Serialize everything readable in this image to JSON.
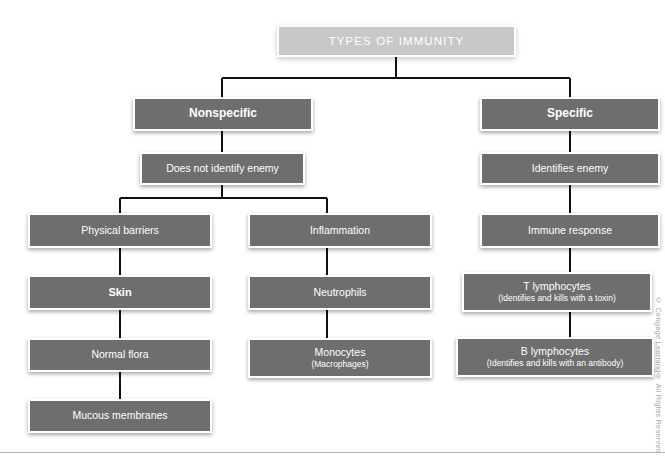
{
  "diagram": {
    "title_box": {
      "label": "TYPES OF IMMUNITY"
    },
    "branches": {
      "nonspecific": {
        "root": "Nonspecific",
        "descriptor": "Does not identify enemy",
        "columns": [
          {
            "heading": "Physical barriers",
            "items": [
              {
                "main": "Skin",
                "sub": ""
              },
              {
                "main": "Normal flora",
                "sub": ""
              },
              {
                "main": "Mucous membranes",
                "sub": ""
              }
            ]
          },
          {
            "heading": "Inflammation",
            "items": [
              {
                "main": "Neutrophils",
                "sub": ""
              },
              {
                "main": "Monocytes",
                "sub": "(Macrophages)"
              }
            ]
          }
        ]
      },
      "specific": {
        "root": "Specific",
        "descriptor": "Identifies enemy",
        "columns": [
          {
            "heading": "Immune response",
            "items": [
              {
                "main": "T lymphocytes",
                "sub": "(Identifies and kills with a toxin)"
              },
              {
                "main": "B lymphocytes",
                "sub": "(Identifies and kills with an antibody)"
              }
            ]
          }
        ]
      }
    }
  },
  "credit": {
    "text": "© Cengage Learning® All Rights Reserved."
  },
  "colors": {
    "title_box_fill": "#c8c8c8",
    "node_fill": "#6e6e6e",
    "node_border": "#ffffff",
    "node_text": "#ffffff",
    "connector": "#000000",
    "page_background": "#ffffff",
    "credit_text": "#a8a8a8"
  }
}
